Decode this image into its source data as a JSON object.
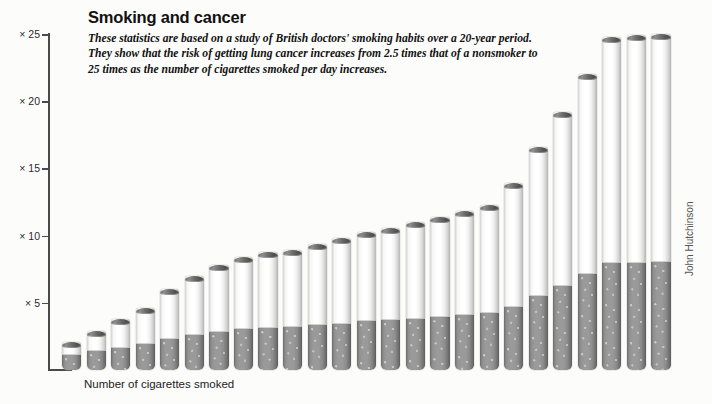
{
  "header": {
    "title": "Smoking and cancer",
    "standfirst": "These statistics are based on a study of British doctors' smoking habits over a 20-year period. They show that the risk of getting lung cancer increases from 2.5 times that of a nonsmoker to 25 times as the number of cigarettes smoked per day increases."
  },
  "credit": "John Hutchinson",
  "chart_data": {
    "type": "bar",
    "title": "Smoking and cancer",
    "xlabel": "Number of cigarettes smoked",
    "ylabel": "",
    "ylim": [
      0,
      25
    ],
    "grid": false,
    "legend": null,
    "note": "Bars are drawn as stylised cigarettes; y value is relative lung-cancer risk versus a nonsmoker.",
    "ytick_labels": [
      "× 25",
      "× 20",
      "× 15",
      "× 10",
      "× 5"
    ],
    "ytick_values": [
      25,
      20,
      15,
      10,
      5
    ],
    "categories": [
      1,
      2,
      3,
      4,
      5,
      6,
      7,
      8,
      9,
      10,
      11,
      12,
      13,
      14,
      15,
      16,
      17,
      18,
      19,
      20,
      21,
      22,
      23,
      24,
      25
    ],
    "values": [
      2.1,
      2.9,
      3.8,
      4.6,
      6.0,
      7.0,
      7.8,
      8.4,
      8.8,
      8.9,
      9.4,
      9.8,
      10.3,
      10.6,
      11.0,
      11.4,
      11.8,
      12.3,
      13.9,
      16.6,
      19.2,
      22.0,
      24.8,
      24.9,
      25.0
    ]
  }
}
